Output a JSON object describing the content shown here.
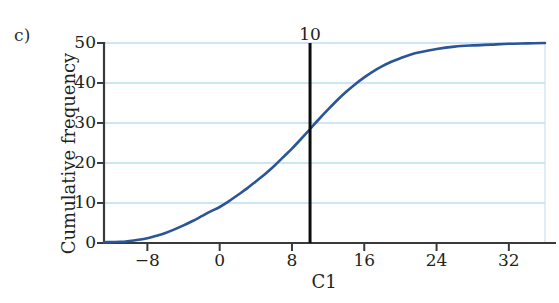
{
  "figure": {
    "panel_label": "c)",
    "background_color": "#ffffff"
  },
  "chart_data": {
    "type": "line",
    "title": "",
    "subtitle": "",
    "xlabel": "C1",
    "ylabel": "Cumulative frequency",
    "xlim": [
      -12.8,
      36.0
    ],
    "ylim": [
      0,
      50
    ],
    "xticks": [
      -8,
      0,
      8,
      16,
      24,
      32
    ],
    "xtick_labels": [
      "−8",
      "0",
      "8",
      "16",
      "24",
      "32"
    ],
    "yticks": [
      0,
      10,
      20,
      30,
      40,
      50
    ],
    "ytick_labels": [
      "0",
      "10",
      "20",
      "30",
      "40",
      "50"
    ],
    "grid": "horizontal-only",
    "grid_color": "#bcdcf0",
    "legend": "none",
    "series": [
      {
        "name": "Cumulative frequency",
        "color": "#2b5596",
        "line_width": 2.6,
        "x": [
          -12.8,
          -11,
          -10,
          -9,
          -8,
          -7,
          -6,
          -5,
          -4,
          -3,
          -2,
          -1,
          0,
          1,
          2,
          3,
          4,
          5,
          6,
          7,
          8,
          9,
          10,
          11,
          12,
          13,
          14,
          15,
          16,
          17,
          18,
          19,
          20,
          21,
          22,
          24,
          26,
          28,
          30,
          32,
          34,
          36
        ],
        "y": [
          0.2,
          0.3,
          0.5,
          0.8,
          1.2,
          1.8,
          2.5,
          3.4,
          4.4,
          5.5,
          6.7,
          7.9,
          9.0,
          10.4,
          12.0,
          13.6,
          15.4,
          17.2,
          19.2,
          21.4,
          23.6,
          26.0,
          28.5,
          31.0,
          33.4,
          35.7,
          37.8,
          39.7,
          41.4,
          42.9,
          44.2,
          45.3,
          46.2,
          47.0,
          47.6,
          48.5,
          49.1,
          49.4,
          49.6,
          49.8,
          49.9,
          50.0
        ]
      }
    ],
    "annotations": [
      {
        "type": "vertical-line",
        "label": "10",
        "x_value": 10,
        "y_from": 0,
        "y_to": 50,
        "color": "#0d0d0d",
        "line_width": 3,
        "curve_intersection_y": 28.5
      }
    ]
  }
}
